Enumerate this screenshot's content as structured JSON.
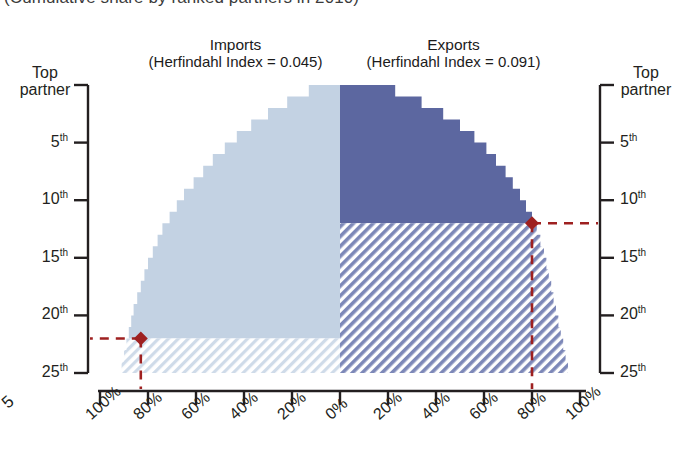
{
  "caption": "(Cumulative share by ranked partners in 2010)",
  "panels": {
    "imports": {
      "title": "Imports",
      "herfindahl": "(Herfindahl Index = 0.045)"
    },
    "exports": {
      "title": "Exports",
      "herfindahl": "(Herfindahl Index = 0.091)"
    }
  },
  "axes": {
    "y_corner_label_line1": "Top",
    "y_corner_label_line2": "partner",
    "y_ticks": [
      "5",
      "10",
      "15",
      "20",
      "25"
    ],
    "y_tick_suffix": "th",
    "x_ticks_left": [
      "100%",
      "80%",
      "60%",
      "40%",
      "20%",
      "0%"
    ],
    "x_ticks_right": [
      "20%",
      "40%",
      "60%",
      "80%",
      "100%"
    ],
    "stray_left_label": "5"
  },
  "colors": {
    "imports_solid": "#c3d2e3",
    "imports_hatch": "#c3d2e3",
    "exports_solid": "#5c67a0",
    "exports_hatch": "#6d78ac",
    "marker": "#9e2020",
    "axis": "#231f20"
  },
  "chart_data": {
    "type": "area",
    "title": "(Cumulative share by ranked partners in 2010)",
    "xlabel": "Cumulative share (%)",
    "ylabel": "Ranked partner",
    "orientation": "horizontal-mirrored",
    "ylim": [
      1,
      25
    ],
    "xlim": [
      0,
      100
    ],
    "grid": false,
    "legend": "none",
    "series": [
      {
        "name": "Imports",
        "herfindahl_index": 0.045,
        "side": "left",
        "color": "#c3d2e3",
        "annotation": {
          "rank": 22,
          "cumulative_share": 83,
          "label": "red-diamond-marker"
        },
        "ranks": [
          1,
          2,
          3,
          4,
          5,
          6,
          7,
          8,
          9,
          10,
          11,
          12,
          13,
          14,
          15,
          16,
          17,
          18,
          19,
          20,
          21,
          22,
          23,
          24,
          25
        ],
        "values": [
          13,
          22,
          30,
          37,
          43,
          48,
          53,
          57,
          61,
          65,
          68,
          71,
          74,
          76,
          78,
          80,
          81.5,
          83,
          84.5,
          86,
          87,
          88,
          89,
          90,
          91
        ]
      },
      {
        "name": "Exports",
        "herfindahl_index": 0.091,
        "side": "right",
        "color": "#5c67a0",
        "annotation": {
          "rank": 12,
          "cumulative_share": 80,
          "label": "red-diamond-marker"
        },
        "ranks": [
          1,
          2,
          3,
          4,
          5,
          6,
          7,
          8,
          9,
          10,
          11,
          12,
          13,
          14,
          15,
          16,
          17,
          18,
          19,
          20,
          21,
          22,
          23,
          24,
          25
        ],
        "values": [
          23,
          34,
          43,
          50,
          56,
          61,
          65,
          69,
          72,
          75,
          77.5,
          80,
          82,
          83.5,
          85,
          86,
          87,
          88,
          89,
          90,
          91,
          92,
          93,
          94,
          95
        ]
      }
    ]
  }
}
